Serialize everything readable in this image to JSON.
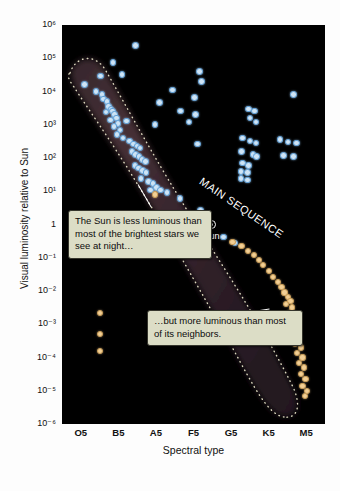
{
  "axes": {
    "y_title": "Visual luminosity relative to Sun",
    "x_title": "Spectral type",
    "y_ticks": [
      "10⁶",
      "10⁵",
      "10⁴",
      "10³",
      "10²",
      "10¹",
      "1",
      "10⁻¹",
      "10⁻²",
      "10⁻³",
      "10⁻⁴",
      "10⁻⁵",
      "10⁻⁶"
    ],
    "x_ticks": [
      "O5",
      "B5",
      "A5",
      "F5",
      "G5",
      "K5",
      "M5"
    ]
  },
  "annotations": {
    "main_sequence_label": "MAIN SEQUENCE",
    "sun_label": "Sun",
    "callout_1": "The Sun is less luminous than most of the brightest stars we see at night…",
    "callout_2": "…but more luminous than most of its neighbors."
  },
  "colors": {
    "plot_background": "#000000",
    "blue_star_fill": "#cfe4f5",
    "blue_star_ring": "#5f9fd6",
    "orange_star_fill": "#f2cf95",
    "orange_star_ring": "#c79b55",
    "band_outline": "#e8e4c8",
    "callout_background": "#dcddc6",
    "callout_border": "#35352c",
    "label_text": "#ffffff"
  },
  "chart_data": {
    "type": "scatter",
    "xlabel": "Spectral type",
    "ylabel": "Visual luminosity relative to Sun",
    "xlim": [
      "O5",
      "M5"
    ],
    "ylim": [
      1e-06,
      1000000.0
    ],
    "yscale": "log",
    "grid": false,
    "legend": "none",
    "x_categories": [
      "O5",
      "B5",
      "A5",
      "F5",
      "G5",
      "K5",
      "M5"
    ],
    "series": [
      {
        "name": "Main sequence and luminous blue stars",
        "color": "#cfe4f5",
        "marker": "circle",
        "points": [
          {
            "x": 0.1,
            "y": 16000.0
          },
          {
            "x": 0.52,
            "y": 29000.0
          },
          {
            "x": 0.86,
            "y": 75000.0
          },
          {
            "x": 1.1,
            "y": 32000.0
          },
          {
            "x": 1.46,
            "y": 240000.0
          },
          {
            "x": 0.4,
            "y": 10000.0
          },
          {
            "x": 0.56,
            "y": 8000.0
          },
          {
            "x": 0.61,
            "y": 6000.0
          },
          {
            "x": 0.7,
            "y": 5000.0
          },
          {
            "x": 0.74,
            "y": 3600.0
          },
          {
            "x": 0.8,
            "y": 3000.0
          },
          {
            "x": 0.85,
            "y": 2600.0
          },
          {
            "x": 0.67,
            "y": 2400.0
          },
          {
            "x": 0.9,
            "y": 2000.0
          },
          {
            "x": 0.95,
            "y": 1600.0
          },
          {
            "x": 0.79,
            "y": 1400.0
          },
          {
            "x": 0.99,
            "y": 1100.0
          },
          {
            "x": 0.88,
            "y": 900.0
          },
          {
            "x": 1.04,
            "y": 700.0
          },
          {
            "x": 0.96,
            "y": 500.0
          },
          {
            "x": 1.12,
            "y": 400.0
          },
          {
            "x": 1.22,
            "y": 1300.0
          },
          {
            "x": 1.3,
            "y": 320.0
          },
          {
            "x": 1.4,
            "y": 260.0
          },
          {
            "x": 1.5,
            "y": 230.0
          },
          {
            "x": 1.58,
            "y": 200.0
          },
          {
            "x": 1.36,
            "y": 160.0
          },
          {
            "x": 1.46,
            "y": 130.0
          },
          {
            "x": 1.55,
            "y": 110.0
          },
          {
            "x": 1.63,
            "y": 90.0
          },
          {
            "x": 1.72,
            "y": 80.0
          },
          {
            "x": 1.44,
            "y": 60.0
          },
          {
            "x": 1.54,
            "y": 50.0
          },
          {
            "x": 1.64,
            "y": 42.0
          },
          {
            "x": 1.74,
            "y": 36.0
          },
          {
            "x": 1.6,
            "y": 24.0
          },
          {
            "x": 1.8,
            "y": 20.0
          },
          {
            "x": 1.92,
            "y": 17.0
          },
          {
            "x": 2.02,
            "y": 13.0
          },
          {
            "x": 2.12,
            "y": 11.0
          },
          {
            "x": 1.86,
            "y": 11.0
          },
          {
            "x": 2.3,
            "y": 9.0
          },
          {
            "x": 2.64,
            "y": 6.0
          },
          {
            "x": 3.18,
            "y": 2.6
          },
          {
            "x": 3.3,
            "y": 1.1
          },
          {
            "x": 3.8,
            "y": 0.42
          },
          {
            "x": 4.1,
            "y": 0.28
          },
          {
            "x": 2.1,
            "y": 4600.0
          },
          {
            "x": 2.44,
            "y": 11000.0
          },
          {
            "x": 1.98,
            "y": 1000.0
          },
          {
            "x": 2.66,
            "y": 2600.0
          },
          {
            "x": 2.88,
            "y": 1200.0
          },
          {
            "x": 3.16,
            "y": 40000.0
          },
          {
            "x": 3.22,
            "y": 20000.0
          },
          {
            "x": 3.02,
            "y": 6500.0
          },
          {
            "x": 3.06,
            "y": 2000.0
          },
          {
            "x": 3.1,
            "y": 260.0
          },
          {
            "x": 4.46,
            "y": 3000.0
          },
          {
            "x": 4.62,
            "y": 2600.0
          },
          {
            "x": 4.5,
            "y": 1600.0
          },
          {
            "x": 4.66,
            "y": 1200.0
          },
          {
            "x": 4.3,
            "y": 400.0
          },
          {
            "x": 4.5,
            "y": 320.0
          },
          {
            "x": 4.66,
            "y": 280.0
          },
          {
            "x": 4.28,
            "y": 160.0
          },
          {
            "x": 4.58,
            "y": 130.0
          },
          {
            "x": 4.68,
            "y": 110.0
          },
          {
            "x": 4.3,
            "y": 70.0
          },
          {
            "x": 4.46,
            "y": 60.0
          },
          {
            "x": 4.26,
            "y": 40.0
          },
          {
            "x": 4.44,
            "y": 36.0
          },
          {
            "x": 4.26,
            "y": 24.0
          },
          {
            "x": 4.44,
            "y": 22.0
          },
          {
            "x": 5.66,
            "y": 8000.0
          },
          {
            "x": 5.3,
            "y": 360.0
          },
          {
            "x": 5.52,
            "y": 300.0
          },
          {
            "x": 5.74,
            "y": 280.0
          },
          {
            "x": 5.4,
            "y": 120.0
          },
          {
            "x": 5.66,
            "y": 110.0
          }
        ]
      },
      {
        "name": "Cool low-luminosity stars and white dwarfs",
        "color": "#f2cf95",
        "marker": "circle",
        "points": [
          {
            "x": 0.52,
            "y": 0.0022
          },
          {
            "x": 0.52,
            "y": 0.0005
          },
          {
            "x": 0.52,
            "y": 0.00016
          },
          {
            "x": 1.98,
            "y": 8.0
          },
          {
            "x": 4.04,
            "y": 0.3
          },
          {
            "x": 4.28,
            "y": 0.22
          },
          {
            "x": 4.46,
            "y": 0.16
          },
          {
            "x": 4.62,
            "y": 0.12
          },
          {
            "x": 4.74,
            "y": 0.085
          },
          {
            "x": 4.86,
            "y": 0.06
          },
          {
            "x": 5.0,
            "y": 0.04
          },
          {
            "x": 5.12,
            "y": 0.026
          },
          {
            "x": 5.24,
            "y": 0.019
          },
          {
            "x": 5.34,
            "y": 0.013
          },
          {
            "x": 5.42,
            "y": 0.009
          },
          {
            "x": 5.52,
            "y": 0.0065
          },
          {
            "x": 5.58,
            "y": 0.005
          },
          {
            "x": 5.46,
            "y": 0.004
          },
          {
            "x": 5.62,
            "y": 0.0032
          },
          {
            "x": 5.54,
            "y": 0.0022
          },
          {
            "x": 5.68,
            "y": 0.0016
          },
          {
            "x": 5.6,
            "y": 0.0011
          },
          {
            "x": 5.74,
            "y": 0.0007
          },
          {
            "x": 5.64,
            "y": 0.0005
          },
          {
            "x": 5.8,
            "y": 0.0004
          },
          {
            "x": 5.7,
            "y": 0.00026
          },
          {
            "x": 5.86,
            "y": 0.0002
          },
          {
            "x": 5.76,
            "y": 0.00014
          },
          {
            "x": 5.9,
            "y": 0.0001
          },
          {
            "x": 5.8,
            "y": 7e-05
          },
          {
            "x": 5.94,
            "y": 5e-05
          },
          {
            "x": 5.86,
            "y": 3.2e-05
          },
          {
            "x": 5.98,
            "y": 2.2e-05
          },
          {
            "x": 5.9,
            "y": 1.4e-05
          },
          {
            "x": 6.02,
            "y": 1e-05
          },
          {
            "x": 5.96,
            "y": 7e-06
          }
        ]
      },
      {
        "name": "Sun",
        "color": "#ffffff",
        "marker": "sun-symbol",
        "points": [
          {
            "x": 3.48,
            "y": 1.0
          }
        ]
      }
    ]
  }
}
